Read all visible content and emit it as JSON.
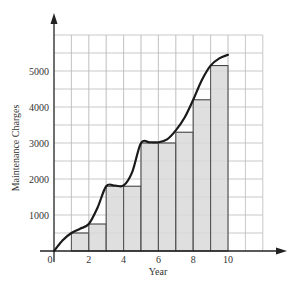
{
  "chart_data": {
    "type": "bar",
    "title": "",
    "xlabel": "Year",
    "ylabel": "Maintenance Charges",
    "xlim": [
      0,
      12
    ],
    "ylim": [
      0,
      6000
    ],
    "grid": true,
    "x_ticks": [
      0,
      2,
      4,
      6,
      8,
      10
    ],
    "x_tick_labels": [
      "0",
      "2",
      "4",
      "6",
      "8",
      "10"
    ],
    "y_ticks": [
      1000,
      2000,
      3000,
      4000,
      5000
    ],
    "y_tick_labels": [
      "1000",
      "2000",
      "3000",
      "4000",
      "5000"
    ],
    "grid_x_step": 1,
    "grid_y_step": 500,
    "bars": {
      "description": "Step bars of width 1 starting at each year",
      "x_start": [
        1,
        2,
        3,
        4,
        5,
        6,
        7,
        8,
        9
      ],
      "width": 1,
      "values": [
        500,
        750,
        1800,
        1800,
        3000,
        3000,
        3300,
        4200,
        5150
      ]
    },
    "curve": {
      "description": "Smooth cumulative maintenance charge curve",
      "x": [
        0,
        0.5,
        1,
        1.5,
        2,
        2.5,
        3,
        3.5,
        4,
        4.5,
        5,
        5.5,
        6,
        6.5,
        7,
        7.5,
        8,
        8.5,
        9,
        9.5,
        10
      ],
      "y": [
        0,
        300,
        500,
        620,
        750,
        1200,
        1800,
        1820,
        1820,
        2200,
        3000,
        3020,
        3020,
        3100,
        3350,
        3700,
        4200,
        4750,
        5150,
        5350,
        5450
      ]
    },
    "colors": {
      "bar_fill": "#d9d9d9",
      "bar_stroke": "#333333",
      "curve": "#1a1a1a",
      "grid": "#bbbbbb",
      "axis": "#222222"
    }
  }
}
